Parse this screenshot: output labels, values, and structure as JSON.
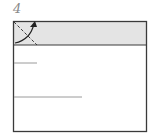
{
  "diagram": {
    "type": "origami-fold-step",
    "step_number": "4",
    "colors": {
      "paper": "#ffffff",
      "shaded_band": "#e4e4e4",
      "outline": "#3a3a3a",
      "crease": "#9a9a9a",
      "arrow": "#222222"
    },
    "elements": [
      "square-paper",
      "shaded-top-band",
      "valley-fold-line",
      "fold-arrow",
      "short-crease",
      "long-crease"
    ]
  }
}
